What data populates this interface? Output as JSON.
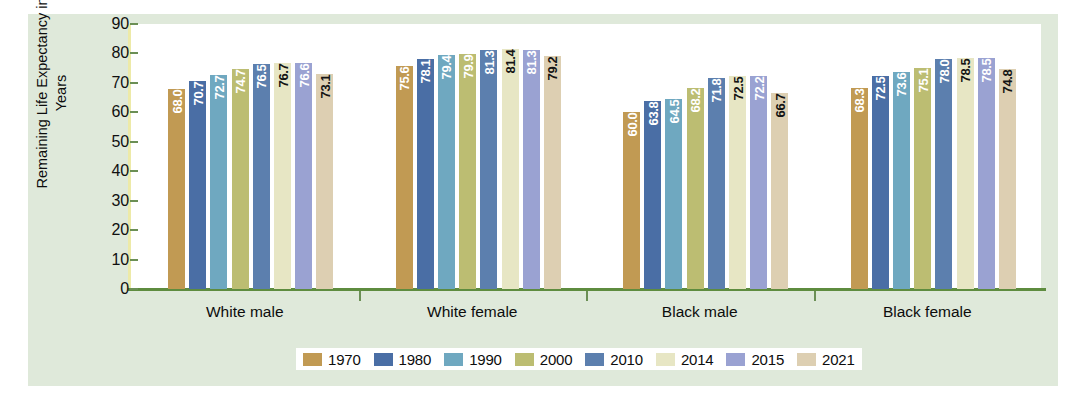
{
  "chart_data": {
    "type": "bar",
    "title": "",
    "xlabel": "",
    "ylabel": "Remaining Life Expectancy in Years",
    "ylim": [
      0,
      90
    ],
    "y_ticks": [
      90,
      80,
      70,
      60,
      50,
      40,
      30,
      20,
      10,
      0
    ],
    "grid": false,
    "legend_position": "bottom",
    "categories": [
      "White male",
      "White female",
      "Black male",
      "Black female"
    ],
    "series": [
      {
        "name": "1970",
        "color": "#c19a53",
        "values": [
          68.0,
          75.6,
          60.0,
          68.3
        ]
      },
      {
        "name": "1980",
        "color": "#4a6ea5",
        "values": [
          70.7,
          78.1,
          63.8,
          72.5
        ]
      },
      {
        "name": "1990",
        "color": "#6fa8c0",
        "values": [
          72.7,
          79.4,
          64.5,
          73.6
        ]
      },
      {
        "name": "2000",
        "color": "#bcbd72",
        "values": [
          74.7,
          79.9,
          68.2,
          75.1
        ]
      },
      {
        "name": "2010",
        "color": "#5c7fae",
        "values": [
          76.5,
          81.3,
          71.8,
          78.0
        ]
      },
      {
        "name": "2014",
        "color": "#e7e6c4",
        "values": [
          76.7,
          81.4,
          72.5,
          78.5
        ]
      },
      {
        "name": "2015",
        "color": "#9aa2d2",
        "values": [
          76.6,
          81.3,
          72.2,
          78.5
        ]
      },
      {
        "name": "2021",
        "color": "#ddcfb2",
        "values": [
          73.1,
          79.2,
          66.7,
          74.8
        ]
      }
    ],
    "bar_labels": [
      [
        "68.0",
        "70.7",
        "72.7",
        "74.7",
        "76.5",
        "76.7",
        "76.6",
        "73.1"
      ],
      [
        "75.6",
        "78.1",
        "79.4",
        "79.9",
        "81.3",
        "81.4",
        "81.3",
        "79.2"
      ],
      [
        "60.0",
        "63.8",
        "64.5",
        "68.2",
        "71.8",
        "72.5",
        "72.2",
        "66.7"
      ],
      [
        "68.3",
        "72.5",
        "73.6",
        "75.1",
        "78.0",
        "78.5",
        "78.5",
        "74.8"
      ]
    ]
  },
  "axis": {
    "y_title": "Remaining Life Expectancy in Years",
    "y_tick_labels": [
      "90",
      "80",
      "70",
      "60",
      "50",
      "40",
      "30",
      "20",
      "10",
      "0"
    ]
  },
  "legend": {
    "entries": [
      {
        "label": "1970",
        "color": "#c19a53"
      },
      {
        "label": "1980",
        "color": "#4a6ea5"
      },
      {
        "label": "1990",
        "color": "#6fa8c0"
      },
      {
        "label": "2000",
        "color": "#bcbd72"
      },
      {
        "label": "2010",
        "color": "#5c7fae"
      },
      {
        "label": "2014",
        "color": "#e7e6c4"
      },
      {
        "label": "2015",
        "color": "#9aa2d2"
      },
      {
        "label": "2021",
        "color": "#ddcfb2"
      }
    ]
  },
  "colors": {
    "panel_background": "#dfe9da",
    "plot_background": "#ffffff",
    "x_axis": "#5e8c3f",
    "y_axis": "#edeaa8"
  }
}
